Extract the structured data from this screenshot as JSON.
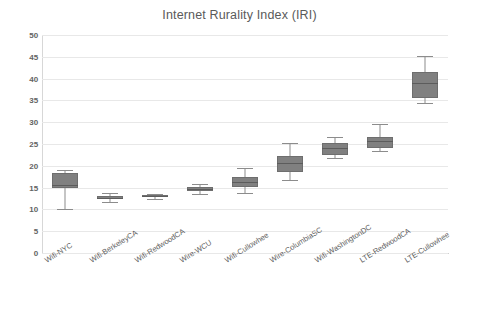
{
  "chart_data": {
    "type": "box",
    "title": "Internet Rurality Index (IRI)",
    "xlabel": "",
    "ylabel": "",
    "ylim": [
      0,
      50
    ],
    "ytick_labels": [
      "50",
      "45",
      "40",
      "35",
      "30",
      "25",
      "20",
      "15",
      "10",
      "5",
      "0"
    ],
    "ytick_values": [
      50,
      45,
      40,
      35,
      30,
      25,
      20,
      15,
      10,
      5,
      0
    ],
    "grid": true,
    "legend": false,
    "box_color": "#808080",
    "line_color": "#8c8c8c",
    "grid_color": "#e8e8e8",
    "categories": [
      "Wifi-NYC",
      "Wifi-BerkeleyCA",
      "Wifi-RedwoodCA",
      "Wire-WCU",
      "Wifi-Cullowhee",
      "Wire-ColumbiaSC",
      "Wifi-WashingtonDC",
      "LTE-RedwoodCA",
      "LTE-Cullowhee"
    ],
    "boxes": [
      {
        "label": "Wifi-NYC",
        "whisker_low": 10.0,
        "q1": 14.9,
        "median": 15.6,
        "q3": 18.3,
        "whisker_high": 19.0
      },
      {
        "label": "Wifi-BerkeleyCA",
        "whisker_low": 11.8,
        "q1": 12.3,
        "median": 12.7,
        "q3": 13.1,
        "whisker_high": 13.8
      },
      {
        "label": "Wifi-RedwoodCA",
        "whisker_low": 12.4,
        "q1": 12.8,
        "median": 13.0,
        "q3": 13.3,
        "whisker_high": 13.6
      },
      {
        "label": "Wire-WCU",
        "whisker_low": 13.5,
        "q1": 14.2,
        "median": 14.7,
        "q3": 15.2,
        "whisker_high": 15.8
      },
      {
        "label": "Wifi-Cullowhee",
        "whisker_low": 13.8,
        "q1": 15.2,
        "median": 16.3,
        "q3": 17.5,
        "whisker_high": 19.5
      },
      {
        "label": "Wire-ColumbiaSC",
        "whisker_low": 16.8,
        "q1": 18.6,
        "median": 20.6,
        "q3": 22.3,
        "whisker_high": 25.2
      },
      {
        "label": "Wifi-WashingtonDC",
        "whisker_low": 21.8,
        "q1": 22.5,
        "median": 24.0,
        "q3": 25.2,
        "whisker_high": 26.5
      },
      {
        "label": "LTE-RedwoodCA",
        "whisker_low": 23.4,
        "q1": 24.1,
        "median": 25.6,
        "q3": 26.6,
        "whisker_high": 29.5
      },
      {
        "label": "LTE-Cullowhee",
        "whisker_low": 34.4,
        "q1": 35.6,
        "median": 39.0,
        "q3": 41.5,
        "whisker_high": 45.2
      }
    ]
  }
}
